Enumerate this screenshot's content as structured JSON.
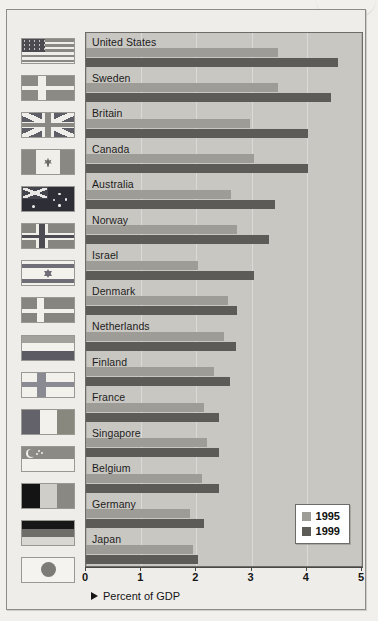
{
  "chart_data": {
    "type": "bar",
    "orientation": "horizontal",
    "title": "",
    "xlabel": "Percent of GDP",
    "ylabel": "",
    "xlim": [
      0,
      5
    ],
    "xticks": [
      "0",
      "1",
      "2",
      "3",
      "4",
      "5"
    ],
    "grid": true,
    "legend_position": "bottom-right",
    "categories": [
      "United States",
      "Sweden",
      "Britain",
      "Canada",
      "Australia",
      "Norway",
      "Israel",
      "Denmark",
      "Netherlands",
      "Finland",
      "France",
      "Singapore",
      "Belgium",
      "Germany",
      "Japan"
    ],
    "series": [
      {
        "name": "1995",
        "color": "#9e9c97",
        "values": [
          3.48,
          3.48,
          2.97,
          3.05,
          2.62,
          2.74,
          2.03,
          2.57,
          2.5,
          2.31,
          2.14,
          2.19,
          2.1,
          1.88,
          1.93
        ]
      },
      {
        "name": "1999",
        "color": "#5d5b57",
        "values": [
          4.57,
          4.43,
          4.02,
          4.02,
          3.43,
          3.31,
          3.05,
          2.74,
          2.72,
          2.6,
          2.41,
          2.41,
          2.41,
          2.14,
          2.03
        ]
      }
    ]
  },
  "legend": {
    "items": [
      {
        "label": "1995",
        "color": "#9e9c97"
      },
      {
        "label": "1999",
        "color": "#5d5b57"
      }
    ]
  },
  "axis": {
    "title": "Percent of GDP",
    "ticks": [
      "0",
      "1",
      "2",
      "3",
      "4",
      "5"
    ]
  },
  "flags": [
    {
      "country": "United States",
      "icon": "flag-united-states"
    },
    {
      "country": "Sweden",
      "icon": "flag-sweden"
    },
    {
      "country": "Britain",
      "icon": "flag-britain"
    },
    {
      "country": "Canada",
      "icon": "flag-canada"
    },
    {
      "country": "Australia",
      "icon": "flag-australia"
    },
    {
      "country": "Norway",
      "icon": "flag-norway"
    },
    {
      "country": "Israel",
      "icon": "flag-israel"
    },
    {
      "country": "Denmark",
      "icon": "flag-denmark"
    },
    {
      "country": "Netherlands",
      "icon": "flag-netherlands"
    },
    {
      "country": "Finland",
      "icon": "flag-finland"
    },
    {
      "country": "France",
      "icon": "flag-france"
    },
    {
      "country": "Singapore",
      "icon": "flag-singapore"
    },
    {
      "country": "Belgium",
      "icon": "flag-belgium"
    },
    {
      "country": "Germany",
      "icon": "flag-germany"
    },
    {
      "country": "Japan",
      "icon": "flag-japan"
    }
  ]
}
